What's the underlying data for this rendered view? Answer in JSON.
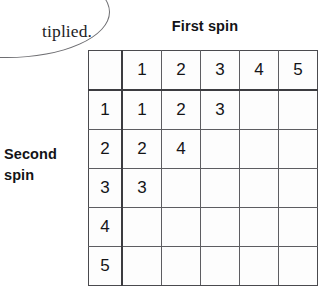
{
  "callout": {
    "text": "tiplied."
  },
  "labels": {
    "first_spin": "First spin",
    "second_spin_line1": "Second",
    "second_spin_line2": "spin"
  },
  "colors": {
    "grid_line": "#5d5d61",
    "grid_line_bold": "#3c3c40",
    "text": "#141417",
    "background": "#ffffff"
  },
  "table": {
    "corner": "",
    "column_headers": [
      "1",
      "2",
      "3",
      "4",
      "5"
    ],
    "row_headers": [
      "1",
      "2",
      "3",
      "4",
      "5"
    ],
    "rows": [
      [
        "1",
        "2",
        "3",
        "",
        ""
      ],
      [
        "2",
        "4",
        "",
        "",
        ""
      ],
      [
        "3",
        "",
        "",
        "",
        ""
      ],
      [
        "",
        "",
        "",
        "",
        ""
      ],
      [
        "",
        "",
        "",
        "",
        ""
      ]
    ]
  }
}
